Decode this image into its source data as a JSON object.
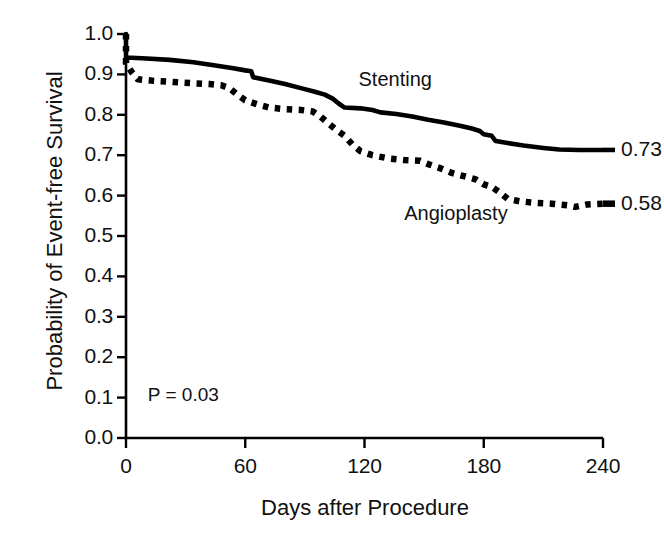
{
  "chart_data": {
    "type": "line",
    "title": "",
    "subtitle": "",
    "xlabel": "Days after Procedure",
    "ylabel": "Probability of Event-free Survival",
    "xlim": [
      0,
      240
    ],
    "ylim": [
      0.0,
      1.0
    ],
    "xticks": [
      0,
      60,
      120,
      180,
      240
    ],
    "xtick_labels": [
      "0",
      "60",
      "120",
      "180",
      "240"
    ],
    "yticks": [
      0.0,
      0.1,
      0.2,
      0.3,
      0.4,
      0.5,
      0.6,
      0.7,
      0.8,
      0.9,
      1.0
    ],
    "ytick_labels": [
      "0.0",
      "0.1",
      "0.2",
      "0.3",
      "0.4",
      "0.5",
      "0.6",
      "0.7",
      "0.8",
      "0.9",
      "1.0"
    ],
    "grid": false,
    "legend_position": "inline-annotation",
    "annotations": [
      {
        "name": "p-value",
        "text": "P = 0.03",
        "x": 11,
        "y": 0.105
      }
    ],
    "series": [
      {
        "name": "Stenting",
        "style": "solid",
        "color": "#000000",
        "label_x": 117,
        "label_y": 0.885,
        "end_value": 0.73,
        "end_label": "0.73",
        "points": [
          [
            0,
            1.0
          ],
          [
            0,
            0.942
          ],
          [
            8,
            0.94
          ],
          [
            22,
            0.936
          ],
          [
            34,
            0.93
          ],
          [
            45,
            0.922
          ],
          [
            54,
            0.915
          ],
          [
            60,
            0.91
          ],
          [
            63,
            0.908
          ],
          [
            64,
            0.893
          ],
          [
            72,
            0.885
          ],
          [
            80,
            0.876
          ],
          [
            88,
            0.866
          ],
          [
            95,
            0.857
          ],
          [
            100,
            0.85
          ],
          [
            104,
            0.84
          ],
          [
            107,
            0.828
          ],
          [
            110,
            0.818
          ],
          [
            118,
            0.816
          ],
          [
            124,
            0.812
          ],
          [
            128,
            0.806
          ],
          [
            136,
            0.802
          ],
          [
            144,
            0.796
          ],
          [
            152,
            0.788
          ],
          [
            160,
            0.781
          ],
          [
            168,
            0.773
          ],
          [
            174,
            0.766
          ],
          [
            178,
            0.76
          ],
          [
            180,
            0.752
          ],
          [
            184,
            0.748
          ],
          [
            186,
            0.735
          ],
          [
            192,
            0.73
          ],
          [
            200,
            0.724
          ],
          [
            210,
            0.718
          ],
          [
            218,
            0.714
          ],
          [
            228,
            0.713
          ],
          [
            240,
            0.713
          ]
        ]
      },
      {
        "name": "Angioplasty",
        "style": "dotted",
        "color": "#000000",
        "label_x": 140,
        "label_y": 0.555,
        "end_value": 0.58,
        "end_label": "0.58",
        "points": [
          [
            0,
            1.0
          ],
          [
            0,
            0.928
          ],
          [
            3,
            0.905
          ],
          [
            6,
            0.888
          ],
          [
            14,
            0.884
          ],
          [
            24,
            0.881
          ],
          [
            34,
            0.878
          ],
          [
            42,
            0.876
          ],
          [
            48,
            0.873
          ],
          [
            52,
            0.866
          ],
          [
            56,
            0.85
          ],
          [
            60,
            0.836
          ],
          [
            66,
            0.826
          ],
          [
            72,
            0.818
          ],
          [
            80,
            0.814
          ],
          [
            88,
            0.812
          ],
          [
            94,
            0.808
          ],
          [
            98,
            0.795
          ],
          [
            102,
            0.778
          ],
          [
            106,
            0.762
          ],
          [
            110,
            0.748
          ],
          [
            114,
            0.726
          ],
          [
            118,
            0.71
          ],
          [
            124,
            0.7
          ],
          [
            132,
            0.692
          ],
          [
            140,
            0.688
          ],
          [
            148,
            0.686
          ],
          [
            152,
            0.678
          ],
          [
            158,
            0.668
          ],
          [
            164,
            0.656
          ],
          [
            170,
            0.648
          ],
          [
            176,
            0.64
          ],
          [
            180,
            0.628
          ],
          [
            184,
            0.622
          ],
          [
            188,
            0.608
          ],
          [
            192,
            0.592
          ],
          [
            198,
            0.586
          ],
          [
            206,
            0.582
          ],
          [
            214,
            0.58
          ],
          [
            222,
            0.576
          ],
          [
            226,
            0.572
          ],
          [
            232,
            0.578
          ],
          [
            240,
            0.58
          ]
        ]
      }
    ]
  },
  "layout": {
    "plot_left_px": 126,
    "plot_right_px": 603,
    "plot_top_px": 34,
    "plot_bottom_px": 438
  }
}
